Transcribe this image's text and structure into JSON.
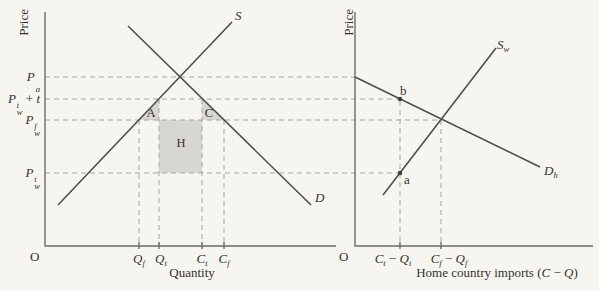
{
  "colors": {
    "background": "#f7f5f0",
    "curve": "#4f4e49",
    "axis": "#6e6d67",
    "dash": "#a6a49e",
    "shade": "#d7d6d1",
    "text": "#33322e"
  },
  "left_panel": {
    "y_axis_label": "Price",
    "x_axis_label": "Quantity",
    "origin_label": "O",
    "curves": {
      "supply": "S",
      "demand": "D"
    },
    "regions": {
      "a": "A",
      "c": "C",
      "h": "H"
    },
    "price_labels": [
      {
        "base": "P",
        "sup": "",
        "sub": "a",
        "plus": "",
        "var": ""
      },
      {
        "base": "P",
        "sup": "t",
        "sub": "w",
        "plus": " + ",
        "var": "t"
      },
      {
        "base": "P",
        "sup": "f",
        "sub": "w",
        "plus": "",
        "var": ""
      },
      {
        "base": "P",
        "sup": "t",
        "sub": "w",
        "plus": "",
        "var": ""
      }
    ],
    "quantity_labels": [
      {
        "base": "Q",
        "sub": "f"
      },
      {
        "base": "Q",
        "sub": "t"
      },
      {
        "base": "C",
        "sub": "t"
      },
      {
        "base": "C",
        "sub": "f"
      }
    ]
  },
  "right_panel": {
    "y_axis_label": "Price",
    "origin_label": "O",
    "curves": {
      "world_supply": {
        "base": "S",
        "sub": "w"
      },
      "import_demand": {
        "base": "D",
        "sub": "h"
      }
    },
    "points": {
      "a": "a",
      "b": "b"
    },
    "import_tick_labels": [
      {
        "c": "C",
        "c_sub": "t",
        "minus": " − ",
        "q": "Q",
        "q_sub": "t"
      },
      {
        "c": "C",
        "c_sub": "f",
        "minus": " − ",
        "q": "Q",
        "q_sub": "f"
      }
    ],
    "x_axis_caption": {
      "prefix": "Home country imports (",
      "c": "C",
      "minus": " − ",
      "q": "Q",
      "close": ")"
    }
  }
}
